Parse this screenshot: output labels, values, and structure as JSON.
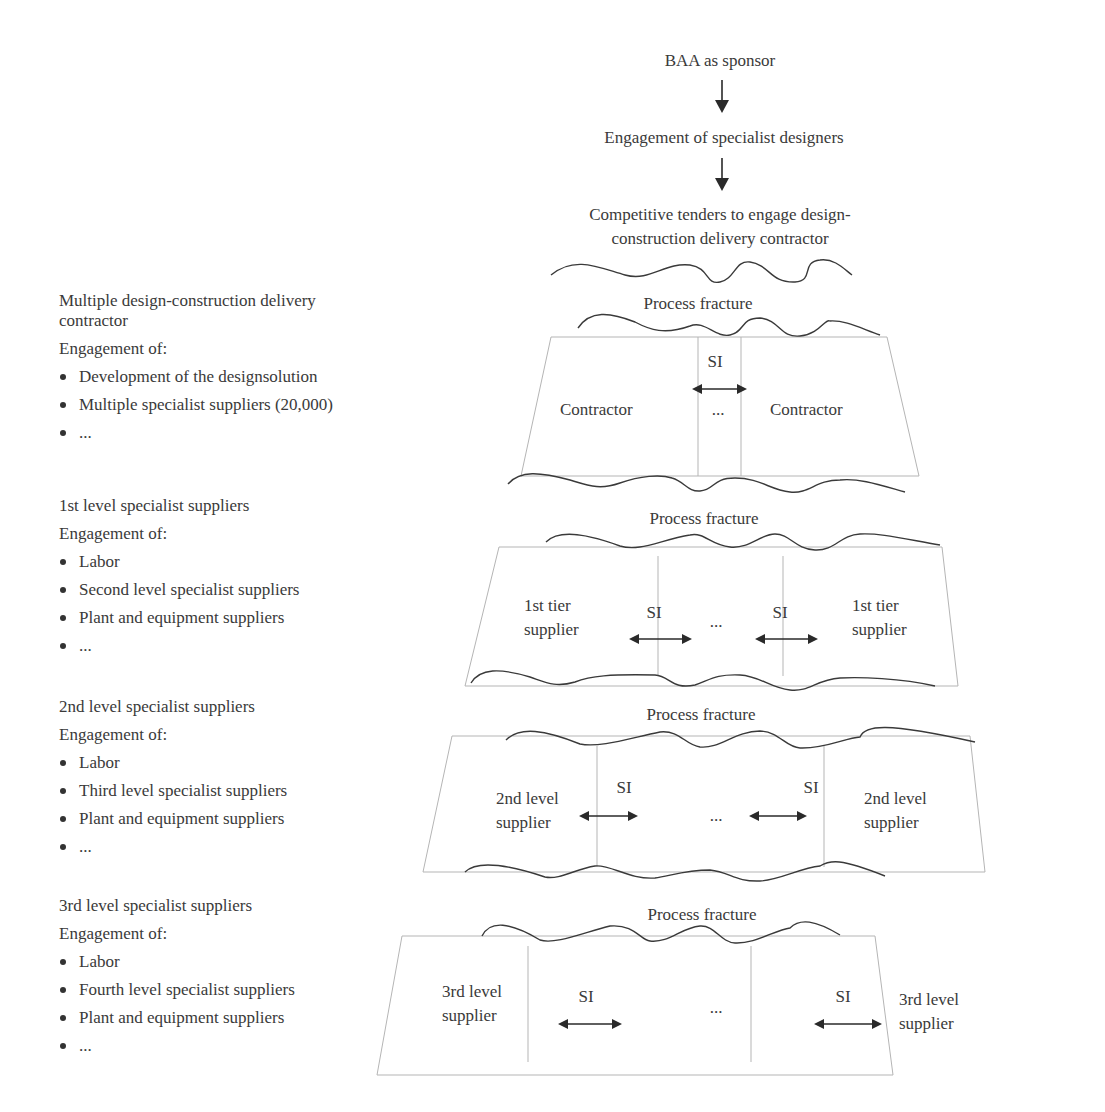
{
  "flow": {
    "sponsor": "BAA as sponsor",
    "designers": "Engagement of specialist designers",
    "tenders_line1": "Competitive tenders to engage design-",
    "tenders_line2": "construction delivery contractor"
  },
  "fracture_label": "Process fracture",
  "si_label": "SI",
  "ellipsis": "...",
  "levels": [
    {
      "heading_line1": "Multiple design-construction delivery",
      "heading_line2": "contractor",
      "engagement": "Engagement of:",
      "items": [
        "Development of the designsolution",
        "Multiple specialist suppliers (20,000)",
        "..."
      ],
      "box_left": "Contractor",
      "box_right": "Contractor"
    },
    {
      "heading_line1": "1st level specialist suppliers",
      "engagement": "Engagement of:",
      "items": [
        "Labor",
        "Second level specialist suppliers",
        "Plant and equipment suppliers",
        "..."
      ],
      "box_left_line1": "1st tier",
      "box_left_line2": "supplier",
      "box_right_line1": "1st tier",
      "box_right_line2": "supplier"
    },
    {
      "heading_line1": "2nd level specialist suppliers",
      "engagement": "Engagement of:",
      "items": [
        "Labor",
        "Third level specialist suppliers",
        "Plant and equipment suppliers",
        "..."
      ],
      "box_left_line1": "2nd level",
      "box_left_line2": "supplier",
      "box_right_line1": "2nd level",
      "box_right_line2": "supplier"
    },
    {
      "heading_line1": "3rd level specialist suppliers",
      "engagement": "Engagement of:",
      "items": [
        "Labor",
        "Fourth level specialist suppliers",
        "Plant and equipment suppliers",
        "..."
      ],
      "box_left_line1": "3rd level",
      "box_left_line2": "supplier",
      "box_right_line1": "3rd level",
      "box_right_line2": "supplier"
    }
  ],
  "colors": {
    "text": "#3a3a3a",
    "box_line": "#b5b5b5",
    "wave": "#3a3a3a",
    "arrow": "#2a2a2a"
  }
}
